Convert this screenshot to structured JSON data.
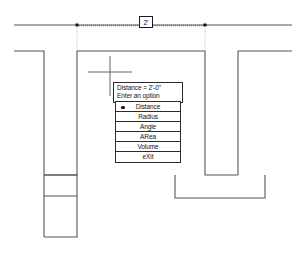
{
  "drawing": {
    "type": "cad-floor-plan",
    "background_color": "#ffffff",
    "wall_color": "#555555",
    "dimension_line_color": "#333333",
    "extension_line_color": "#999999"
  },
  "dimension": {
    "label": "2'",
    "line_y": 25,
    "start_x": 77,
    "end_x": 205
  },
  "cursor": {
    "name": "crosshair",
    "x": 110,
    "y": 72
  },
  "tooltip": {
    "line1": "Distance = 2'-0\"",
    "line2": "Enter an option"
  },
  "option_menu": {
    "selected": "Distance",
    "items": [
      {
        "label": "Distance",
        "selected": true
      },
      {
        "label": "Radius",
        "selected": false
      },
      {
        "label": "Angle",
        "selected": false
      },
      {
        "label": "ARea",
        "selected": false
      },
      {
        "label": "Volume",
        "selected": false
      },
      {
        "label": "eXit",
        "selected": false
      }
    ]
  }
}
